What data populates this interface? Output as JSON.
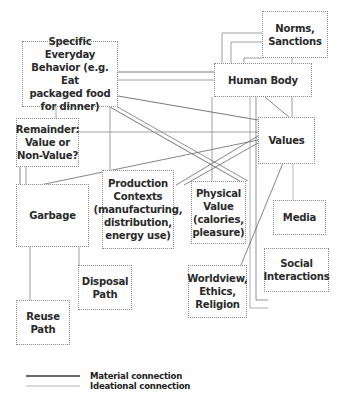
{
  "diagram": {
    "nodes": [
      {
        "id": "behavior",
        "label": "Specific Everyday\nBehavior (e.g. Eat\npackaged food\nfor dinner)"
      },
      {
        "id": "norms",
        "label": "Norms,\nSanctions"
      },
      {
        "id": "body",
        "label": "Human Body"
      },
      {
        "id": "remainder",
        "label": "Remainder:\nValue or\nNon-Value?"
      },
      {
        "id": "values",
        "label": "Values"
      },
      {
        "id": "garbage",
        "label": "Garbage"
      },
      {
        "id": "production",
        "label": "Production\nContexts\n(manufacturing,\ndistribution,\nenergy use)"
      },
      {
        "id": "physical",
        "label": "Physical\nValue\n(calories,\npleasure)"
      },
      {
        "id": "media",
        "label": "Media"
      },
      {
        "id": "social",
        "label": "Social\nInteractions"
      },
      {
        "id": "worldview",
        "label": "Worldview,\nEthics,\nReligion"
      },
      {
        "id": "disposal",
        "label": "Disposal\nPath"
      },
      {
        "id": "reuse",
        "label": "Reuse\nPath"
      }
    ],
    "legend": {
      "material": "Material connection",
      "ideational": "Ideational connection"
    },
    "colors": {
      "material_line": "#3a3a3a",
      "ideational_line": "#b5b5b5",
      "node_border": "#8a8a8a",
      "text": "#2a2a2a"
    }
  }
}
